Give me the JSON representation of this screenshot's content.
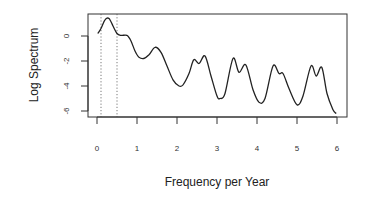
{
  "chart_data": {
    "type": "line",
    "title": "",
    "xlabel": "Frequency per Year",
    "ylabel": "Log Spectrum",
    "xlim": [
      -0.22,
      6.25
    ],
    "ylim": [
      -6.5,
      1.75
    ],
    "xticks": [
      0,
      1,
      2,
      3,
      4,
      5,
      6
    ],
    "yticks": [
      0,
      -2,
      -4,
      -6
    ],
    "grid": false,
    "legend": null,
    "vertical_reference_lines": [
      {
        "x": 0.1,
        "style": "dotted"
      },
      {
        "x": 0.5,
        "style": "dotted"
      }
    ],
    "series": [
      {
        "name": "Log Spectrum",
        "x": [
          0.02,
          0.1,
          0.2,
          0.3,
          0.4,
          0.5,
          0.6,
          0.75,
          0.85,
          0.95,
          1.05,
          1.17,
          1.3,
          1.45,
          1.6,
          1.75,
          1.9,
          2.05,
          2.15,
          2.3,
          2.42,
          2.55,
          2.7,
          2.85,
          3.0,
          3.08,
          3.2,
          3.4,
          3.55,
          3.72,
          3.9,
          4.05,
          4.2,
          4.4,
          4.55,
          4.65,
          4.8,
          5.0,
          5.15,
          5.35,
          5.48,
          5.62,
          5.75,
          5.9,
          5.98
        ],
        "values": [
          0.2,
          0.6,
          1.3,
          1.4,
          0.8,
          0.2,
          0.05,
          0.05,
          -0.4,
          -1.2,
          -1.7,
          -1.8,
          -1.5,
          -0.9,
          -1.3,
          -2.4,
          -3.5,
          -4.0,
          -3.9,
          -3.0,
          -1.9,
          -2.2,
          -1.6,
          -3.2,
          -4.8,
          -5.0,
          -4.6,
          -1.8,
          -2.9,
          -2.3,
          -4.3,
          -5.3,
          -5.0,
          -2.4,
          -3.0,
          -3.0,
          -4.2,
          -5.5,
          -4.8,
          -2.4,
          -3.2,
          -2.5,
          -4.6,
          -5.9,
          -6.2
        ]
      }
    ]
  },
  "axes": {
    "x_title": "Frequency per Year",
    "y_title": "Log Spectrum",
    "x_tick_labels": [
      "0",
      "1",
      "2",
      "3",
      "4",
      "5",
      "6"
    ],
    "y_tick_labels": [
      "0",
      "-2",
      "-4",
      "-6"
    ]
  }
}
